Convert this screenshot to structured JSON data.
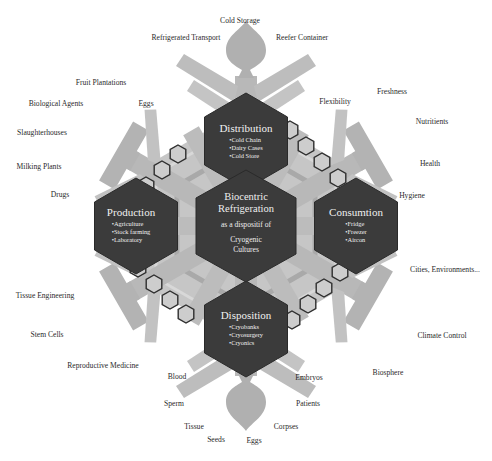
{
  "diagram": {
    "center": {
      "title_line1": "Biocentric",
      "title_line2": "Refrigeration",
      "subtitle": "as a dispositif of",
      "tail_line1": "Cryogenic",
      "tail_line2": "Cultures"
    },
    "nodes": [
      {
        "id": "distribution",
        "title": "Distribution",
        "items": [
          "Cold Chain",
          "Dairy Cases",
          "Cold Store"
        ]
      },
      {
        "id": "production",
        "title": "Production",
        "items": [
          "Agriculture",
          "Stock farming",
          "Laboratory"
        ]
      },
      {
        "id": "consumption",
        "title": "Consumtion",
        "items": [
          "Fridge",
          "Freezer",
          "Aircon"
        ]
      },
      {
        "id": "disposition",
        "title": "Disposition",
        "items": [
          "Cryobanks",
          "Cryosurgery",
          "Cryonics"
        ]
      }
    ],
    "labels": {
      "top": [
        "Cold Storage",
        "Refrigerated Transport",
        "Reefer Container"
      ],
      "upper_left": [
        "Fruit Plantations",
        "Biological Agents",
        "Eggs",
        "Slaughterhouses",
        "Milking Plants",
        "Drugs"
      ],
      "upper_right": [
        "Flexibility",
        "Freshness",
        "Nutritients",
        "Health",
        "Hygiene"
      ],
      "lower_right": [
        "Cities, Environments...",
        "Climate Control",
        "Biosphere"
      ],
      "lower_left": [
        "Tissue Engineering",
        "Stem Cells",
        "Reproductive Medicine"
      ],
      "bottom": [
        "Blood",
        "Sperm",
        "Tissue",
        "Seeds",
        "Eggs",
        "Corpses",
        "Patients",
        "Embryos"
      ]
    },
    "colors": {
      "hex_fill": "#3a3a3a",
      "flake_fill": "#b4b4b4",
      "flake_light": "#cfcfcf",
      "small_hex_fill": "#c8c8c8",
      "small_hex_stroke": "#2e2e2e"
    }
  }
}
